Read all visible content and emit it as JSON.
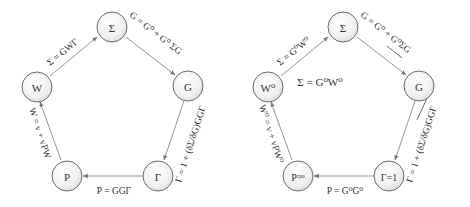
{
  "diagrams": [
    {
      "name": "hedin-full",
      "nodes": {
        "sigma": "Σ",
        "g": "G",
        "gamma": "Γ",
        "p": "P",
        "w": "W"
      },
      "edges": {
        "w_to_sigma": "Σ = GWΓ",
        "sigma_to_g": "G = G⁰ + G⁰ ΣG",
        "g_to_gamma": "Γ = 1 + (δΣ/δG)GGΓ",
        "gamma_to_p": "P = GGΓ",
        "p_to_w": "W = v + vPW"
      }
    },
    {
      "name": "gw-approximation",
      "nodes": {
        "sigma": "Σ",
        "g": "G",
        "gamma": "Γ=1",
        "p": "Pʳᵖᵃ",
        "w": "W⁰"
      },
      "edges": {
        "w_to_sigma": "Σ = G⁰W⁰",
        "sigma_to_g": "G = G⁰ + G⁰ΣG",
        "g_to_gamma": "Γ = 1 + (δΣ/δG)GGΓ",
        "gamma_to_p": "P = G⁰G⁰",
        "p_to_w": "W⁰ = v + vPW⁰"
      },
      "center_label": "Σ = G⁰W⁰",
      "struck_edges": [
        "sigma_to_g",
        "g_to_gamma"
      ]
    }
  ]
}
